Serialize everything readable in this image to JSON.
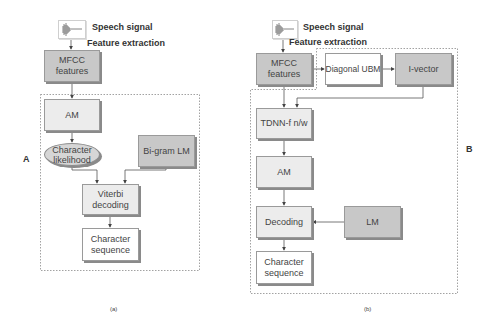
{
  "figure": {
    "panel_a": {
      "letter": "A",
      "caption": "(a)",
      "input_label": "Speech signal",
      "feature_label": "Feature extraction",
      "nodes": {
        "mfcc": "MFCC features",
        "am": "AM",
        "char_likelihood": "Character likelihood",
        "bigram_lm": "Bi-gram LM",
        "viterbi": "Viterbi decoding",
        "char_sequence": "Character sequence"
      }
    },
    "panel_b": {
      "letter": "B",
      "caption": "(b)",
      "input_label": "Speech signal",
      "feature_label": "Feature extraction",
      "nodes": {
        "mfcc": "MFCC features",
        "diag_ubm": "Diagonal UBM",
        "ivector": "I-vector",
        "tdnn": "TDNN-f n/w",
        "am": "AM",
        "decoding": "Decoding",
        "lm": "LM",
        "char_sequence": "Character sequence"
      }
    },
    "colors": {
      "dark_box": "#c8c8c8",
      "light_box": "#ececec",
      "white_box": "#ffffff",
      "line": "#555555",
      "dashed_frame": "#8a8a8a"
    }
  }
}
